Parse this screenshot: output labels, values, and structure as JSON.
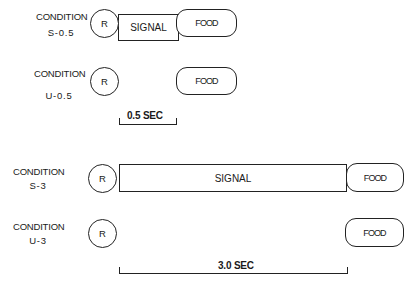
{
  "conditions": [
    {
      "line1": "CONDITION",
      "line2": "S-0.5",
      "circle": "R",
      "signal": "SIGNAL",
      "food": "FOOD"
    },
    {
      "line1": "CONDITION",
      "line2": "U-0.5",
      "circle": "R",
      "food": "FOOD"
    },
    {
      "line1": "CONDITION",
      "line2": "S-3",
      "circle": "R",
      "signal": "SIGNAL",
      "food": "FOOD"
    },
    {
      "line1": "CONDITION",
      "line2": "U-3",
      "circle": "R",
      "food": "FOOD"
    }
  ],
  "scales": [
    {
      "label": "0.5 SEC"
    },
    {
      "label": "3.0 SEC"
    }
  ]
}
